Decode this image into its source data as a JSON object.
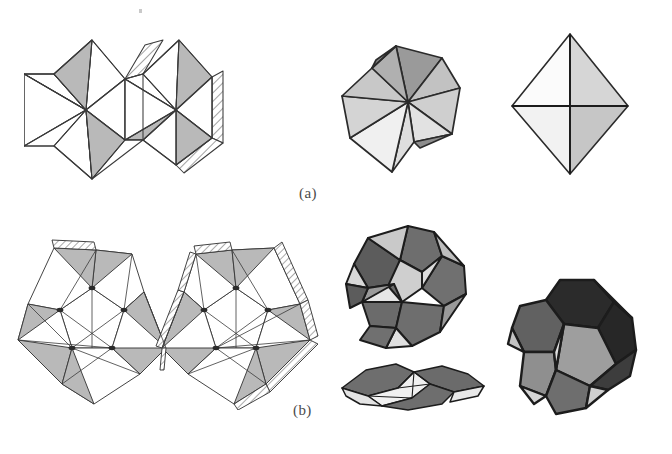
{
  "figure": {
    "caption_a": "(a)",
    "caption_b": "(b)",
    "background_color": "#ffffff",
    "ink_color": "#3a3a3a"
  },
  "palette": {
    "white_face": "#ffffff",
    "light_gray": "#dcdcdc",
    "pale_gray": "#ececec",
    "mid_gray": "#b5b5b5",
    "gusset_gray": "#b9b9b9",
    "medium_gray": "#9a9a9a",
    "dark_gray": "#6e6e6e",
    "darker_gray": "#545454",
    "near_black": "#2b2b2b",
    "outline": "#3a3a3a",
    "heavy_outline": "#1c1c1c"
  },
  "rows": [
    {
      "id": "row-a",
      "label": "(a)",
      "solid_name": "octahedron",
      "stages": [
        {
          "id": "net-octahedron",
          "name": "unfolded-net",
          "stage": "flat net with hatched glue tabs"
        },
        {
          "id": "partial-octahedron",
          "name": "partially-folded",
          "stage": "partially folded"
        },
        {
          "id": "solid-octahedron",
          "name": "folded-solid",
          "stage": "fully folded octahedron"
        }
      ]
    },
    {
      "id": "row-b",
      "label": "(b)",
      "solid_name": "dodecahedron",
      "stages": [
        {
          "id": "net-dodecahedron",
          "name": "unfolded-net",
          "stage": "flat net with hatched glue tabs"
        },
        {
          "id": "partial-dodecahedron",
          "name": "partially-folded",
          "stage": "partially folded"
        },
        {
          "id": "collapsed-dodecahedron",
          "name": "collapsed-view",
          "stage": "flattened / edge-on view"
        },
        {
          "id": "solid-dodecahedron",
          "name": "folded-solid",
          "stage": "fully folded dodecahedron"
        }
      ]
    }
  ]
}
